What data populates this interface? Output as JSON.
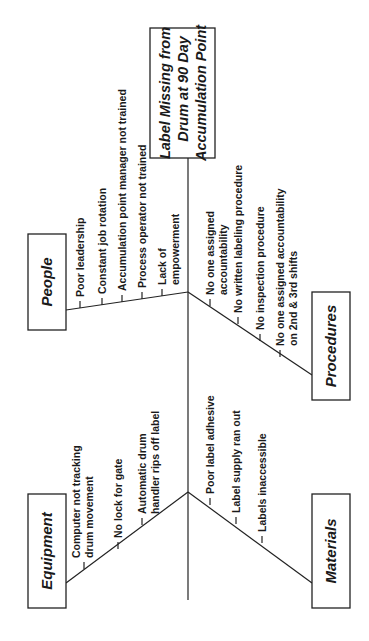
{
  "diagram": {
    "type": "fishbone (cause-and-effect)",
    "orientation": "rotated 90 degrees counter-clockwise",
    "effect": {
      "lines": [
        "Label Missing from",
        "Drum at 90 Day",
        "Accumulation Point"
      ]
    },
    "categories": [
      {
        "name": "People",
        "causes": [
          [
            "Poor leadership"
          ],
          [
            "Constant job rotation"
          ],
          [
            "Accumulation point manager not trained"
          ],
          [
            "Process operator not trained"
          ],
          [
            "Lack of",
            "empowerment"
          ]
        ]
      },
      {
        "name": "Equipment",
        "causes": [
          [
            "Computer not tracking",
            "drum movement"
          ],
          [
            "No lock for gate"
          ],
          [
            "Automatic drum",
            "handler rips off label"
          ]
        ]
      },
      {
        "name": "Procedures",
        "causes": [
          [
            "No one assigned",
            "accountability"
          ],
          [
            "No written labeling procedure"
          ],
          [
            "No inspection procedure"
          ],
          [
            "No one assigned accountability",
            "on 2nd & 3rd shifts"
          ]
        ]
      },
      {
        "name": "Materials",
        "causes": [
          [
            "Poor label adhesive"
          ],
          [
            "Label supply ran out"
          ],
          [
            "Labels inaccessible"
          ]
        ]
      }
    ]
  }
}
